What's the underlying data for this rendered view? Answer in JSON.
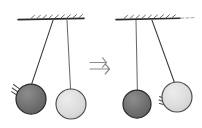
{
  "figure": {
    "title": "Pendulum collision: momentum transfer between two suspended balls",
    "width": 202,
    "height": 128,
    "background_color": "#ffffff",
    "panels": [
      {
        "id": "before",
        "label": "Before collision",
        "caption": "",
        "ceiling": {
          "label": "ceiling-support",
          "x1": 18,
          "x2": 84,
          "y": 19,
          "color": "#2b2b2b",
          "thickness": 1.6,
          "hatch_count": 9,
          "hatch_color": "#555555"
        },
        "pendulums": [
          {
            "id": "dark-ball-swinging",
            "ball_label": "dark ball",
            "state": "swinging inward",
            "pivot_x": 53,
            "pivot_y": 21,
            "ball_cx": 31,
            "ball_cy": 99,
            "radius": 15,
            "fill": "#6e6e6e",
            "stroke": "#2b2b2b",
            "string_color": "#3a3a3a",
            "motion_lines": {
              "present": true,
              "position": "upper-left",
              "count": 3,
              "color": "#4a4a4a"
            }
          },
          {
            "id": "light-ball-at-rest",
            "ball_label": "light ball",
            "state": "at rest",
            "pivot_x": 67,
            "pivot_y": 21,
            "ball_cx": 71,
            "ball_cy": 104,
            "radius": 15,
            "fill": "#dcdcdc",
            "stroke": "#4a4a4a",
            "string_color": "#6a6a6a",
            "motion_lines": {
              "present": false,
              "position": "",
              "count": 0,
              "color": "#4a4a4a"
            }
          }
        ]
      },
      {
        "id": "after",
        "label": "After collision",
        "caption": "",
        "ceiling": {
          "label": "ceiling-support",
          "x1": 116,
          "x2": 182,
          "y": 19,
          "color": "#2b2b2b",
          "thickness": 1.6,
          "hatch_count": 9,
          "hatch_color": "#555555"
        },
        "pendulums": [
          {
            "id": "dark-ball-at-rest",
            "ball_label": "dark ball",
            "state": "at rest",
            "pivot_x": 136,
            "pivot_y": 21,
            "ball_cx": 137,
            "ball_cy": 104,
            "radius": 14,
            "fill": "#6e6e6e",
            "stroke": "#2b2b2b",
            "string_color": "#6a6a6a",
            "motion_lines": {
              "present": false,
              "position": "",
              "count": 0,
              "color": "#4a4a4a"
            }
          },
          {
            "id": "light-ball-swinging",
            "ball_label": "light ball",
            "state": "swinging outward",
            "pivot_x": 152,
            "pivot_y": 21,
            "ball_cx": 177,
            "ball_cy": 97,
            "radius": 15,
            "fill": "#dcdcdc",
            "stroke": "#4a4a4a",
            "string_color": "#3a3a3a",
            "motion_lines": {
              "present": true,
              "position": "lower-left",
              "count": 3,
              "color": "#4a4a4a"
            }
          }
        ]
      }
    ],
    "transition_arrow": {
      "label": "double chevron arrow pointing right",
      "glyph": "⇒",
      "x": 101,
      "y": 66,
      "color": "#8a8a8a",
      "direction": "right"
    }
  }
}
